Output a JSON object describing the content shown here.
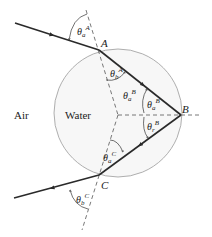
{
  "diagram": {
    "regions": {
      "outside": "Air",
      "inside": "Water"
    },
    "points": {
      "A": "A",
      "B": "B",
      "C": "C"
    },
    "angles": [
      {
        "id": "theta-a-A",
        "symbol": "θ",
        "sub": "a",
        "sup": "A"
      },
      {
        "id": "theta-b-A",
        "symbol": "θ",
        "sub": "b",
        "sup": "A"
      },
      {
        "id": "theta-a-B-1",
        "symbol": "θ",
        "sub": "a",
        "sup": "B"
      },
      {
        "id": "theta-a-B-2",
        "symbol": "θ",
        "sub": "a",
        "sup": "B"
      },
      {
        "id": "theta-r-B",
        "symbol": "θ",
        "sub": "r",
        "sup": "B"
      },
      {
        "id": "theta-a-C",
        "symbol": "θ",
        "sub": "a",
        "sup": "C"
      },
      {
        "id": "theta-b-C",
        "symbol": "θ",
        "sub": "b",
        "sup": "C"
      }
    ],
    "colors": {
      "ray": "#2a2a2a",
      "circle_stroke": "#9a9a9a",
      "circle_fill": "#f7f7f7",
      "dashed": "#555555"
    }
  }
}
